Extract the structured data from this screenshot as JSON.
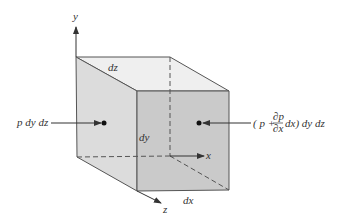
{
  "diagram": {
    "type": "pressure-forces-on-fluid-element",
    "colors": {
      "background": "#ffffff",
      "top_face": "#efefef",
      "left_face": "#dcdcdc",
      "front_face": "#cacaca",
      "edge": "#555555",
      "text": "#333333"
    },
    "axes": {
      "x_label": "x",
      "y_label": "y",
      "z_label": "z"
    },
    "dimensions": {
      "top_label": "dz",
      "height_label": "dy",
      "width_label": "dx"
    },
    "forces": {
      "left": {
        "label": "p dy dz"
      },
      "right": {
        "prefix": "( p +",
        "frac_num": "∂p",
        "frac_den": "∂x",
        "suffix": "dx) dy dz"
      }
    }
  }
}
